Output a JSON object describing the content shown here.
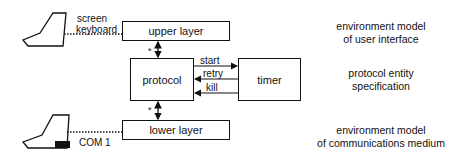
{
  "diagram": {
    "boxes": {
      "upper_layer": "upper layer",
      "protocol": "protocol",
      "timer": "timer",
      "lower_layer": "lower layer"
    },
    "terminal_labels": {
      "screen": "screen",
      "keyboard": "keyboard",
      "com": "COM 1"
    },
    "signals": {
      "start": "start",
      "retry": "retry",
      "kill": "kill"
    },
    "multiplicity": {
      "upper": "*",
      "lower": "*"
    },
    "descriptions": {
      "top_line1": "environment model",
      "top_line2": "of user interface",
      "middle_line1": "protocol entity",
      "middle_line2": "specification",
      "bottom_line1": "environment model",
      "bottom_line2": "of communications medium"
    }
  }
}
